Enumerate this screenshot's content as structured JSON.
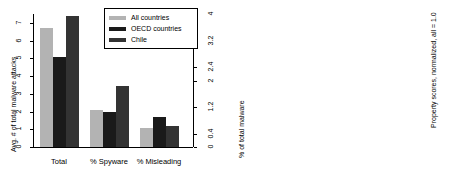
{
  "figure": {
    "panels": [
      "left",
      "right"
    ]
  },
  "legend": {
    "items": [
      {
        "label": "All countries",
        "color": "#b3b3b3",
        "key": "all"
      },
      {
        "label": "OECD countries",
        "color": "#1a1a1a",
        "key": "oecd"
      },
      {
        "label": "Chile",
        "color": "#333333",
        "key": "chile"
      }
    ]
  },
  "chart_data": [
    {
      "type": "bar",
      "id": "malware-panel",
      "title": "",
      "xlabel": "",
      "ylabel": "Avg. # of total malware attacks",
      "ylabel_right": "% of total malware",
      "ylim": [
        0,
        7.5
      ],
      "yticks": [
        0,
        1,
        2,
        3,
        4,
        5,
        6,
        7
      ],
      "yticklabels": [
        "0",
        "1",
        "2",
        "3",
        "4",
        "5",
        "6",
        "7"
      ],
      "ylim_right": [
        0,
        4
      ],
      "yticks_right": [
        0,
        0.4,
        1.2,
        2,
        2.4,
        3.2,
        4
      ],
      "yticklabels_right": [
        "0",
        "0.4",
        "1.2",
        "2",
        "2.4",
        "3.2",
        "4"
      ],
      "grid": false,
      "legend_position": "top-right",
      "categories": [
        "Total",
        "% Spyware",
        "% Misleading"
      ],
      "series": [
        {
          "name": "All countries",
          "values": [
            6.7,
            2.1,
            1.1
          ]
        },
        {
          "name": "OECD countries",
          "values": [
            5.05,
            2.0,
            1.7
          ]
        },
        {
          "name": "Chile",
          "values": [
            7.4,
            3.45,
            1.2
          ]
        }
      ]
    },
    {
      "type": "bar",
      "id": "property-scores-panel",
      "title": "",
      "xlabel": "",
      "ylabel": "Property scores, normalized, all = 1.0",
      "ylim": [
        0,
        1.45
      ],
      "yticks": [
        0.0,
        0.2,
        0.4,
        0.6,
        0.8,
        1.0,
        1.2,
        1.4
      ],
      "yticklabels": [
        "0.0",
        "0.2",
        "0.4",
        "0.6",
        "0.8",
        "1.0",
        "1.2",
        "1.4"
      ],
      "grid": false,
      "legend_position": "top-right",
      "categories": [
        "% Low. Preval.",
        "% Unsign.",
        "% Downl."
      ],
      "series": [
        {
          "name": "All countries",
          "values": [
            1.0,
            1.0,
            1.0
          ]
        },
        {
          "name": "OECD countries",
          "values": [
            0.875,
            0.97,
            1.1
          ]
        },
        {
          "name": "Chile",
          "values": [
            0.83,
            0.97,
            1.0
          ]
        }
      ]
    }
  ]
}
